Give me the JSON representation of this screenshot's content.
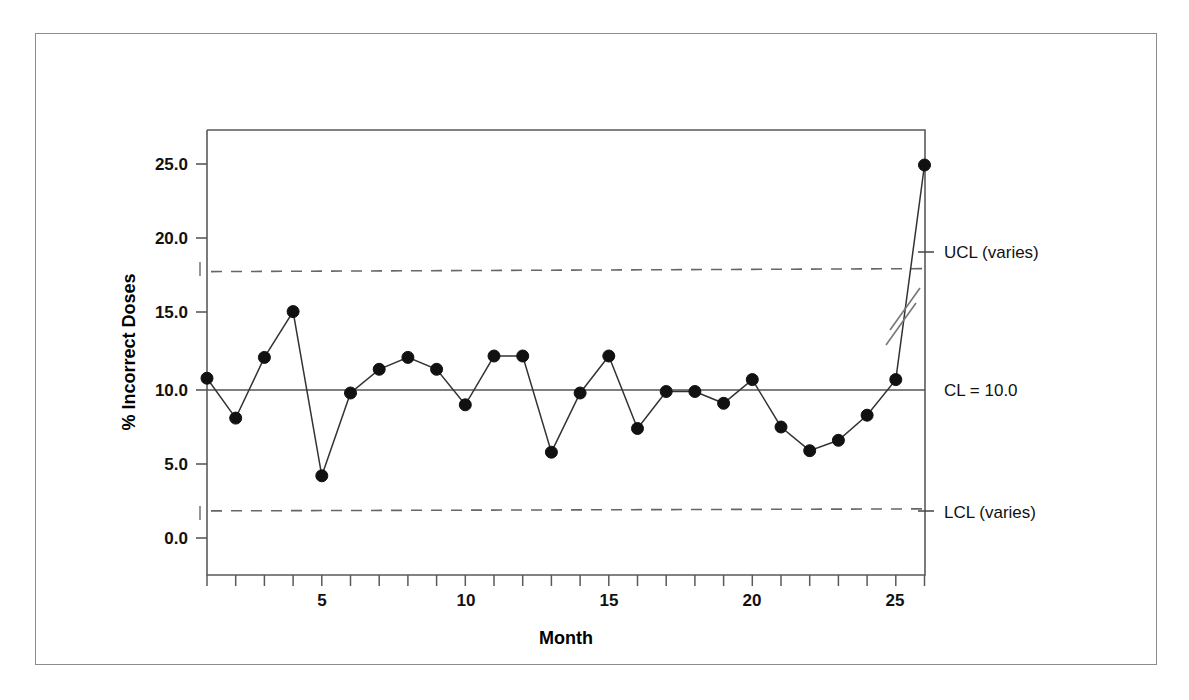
{
  "chart_data": {
    "type": "line",
    "title": "",
    "subtitle": "",
    "xlabel": "Month",
    "ylabel": "% Incorrect Doses",
    "x": [
      1,
      2,
      3,
      4,
      5,
      6,
      7,
      8,
      9,
      10,
      11,
      12,
      13,
      14,
      15,
      16,
      17,
      18,
      19,
      20,
      21,
      22,
      23,
      24,
      25,
      26
    ],
    "values": [
      10.8,
      8.1,
      12.2,
      15.3,
      4.2,
      9.8,
      11.4,
      12.2,
      11.4,
      9.0,
      12.3,
      12.3,
      5.8,
      9.8,
      12.3,
      7.4,
      9.9,
      9.9,
      9.1,
      10.7,
      7.5,
      5.9,
      6.6,
      8.3,
      10.7,
      25.2
    ],
    "series": [
      {
        "name": "% Incorrect Doses",
        "values": [
          10.8,
          8.1,
          12.2,
          15.3,
          4.2,
          9.8,
          11.4,
          12.2,
          11.4,
          9.0,
          12.3,
          12.3,
          5.8,
          9.8,
          12.3,
          7.4,
          9.9,
          9.9,
          9.1,
          10.7,
          7.5,
          5.9,
          6.6,
          8.3,
          10.7,
          25.2
        ]
      }
    ],
    "xlim": [
      0.95,
      26.2
    ],
    "ylim": [
      -0.7,
      27.3
    ],
    "xticks": [
      1,
      2,
      3,
      4,
      5,
      6,
      7,
      8,
      9,
      10,
      11,
      12,
      13,
      14,
      15,
      16,
      17,
      18,
      19,
      20,
      21,
      22,
      23,
      24,
      25,
      26
    ],
    "xtick_labels": [
      "",
      "",
      "",
      "",
      "5",
      "",
      "",
      "",
      "",
      "10",
      "",
      "",
      "",
      "",
      "15",
      "",
      "",
      "",
      "",
      "20",
      "",
      "",
      "",
      "",
      "25",
      ""
    ],
    "yticks": [
      0.0,
      5.0,
      10.0,
      15.0,
      20.0,
      25.0
    ],
    "ytick_labels": [
      "0.0",
      "5.0",
      "10.0",
      "15.0",
      "20.0",
      "25.0"
    ],
    "grid": false,
    "legend_position": "right-outside",
    "marker": "filled-circle",
    "marker_color": "#111111",
    "line_color": "#333333",
    "control_limits": {
      "center_line": {
        "label": "CL = 10.0",
        "value": 10.0,
        "style": "solid"
      },
      "upper_control_limit": {
        "label": "UCL (varies)",
        "value": 18.1,
        "style": "dashed"
      },
      "lower_control_limit": {
        "label": "LCL (varies)",
        "value": 1.9,
        "style": "dashed"
      }
    },
    "axis_break": {
      "present": true,
      "description": "double slash break on rising segment before final point"
    }
  },
  "annotations": {
    "ucl_text": "UCL (varies)",
    "cl_text": "CL = 10.0",
    "lcl_text": "LCL (varies)"
  },
  "axes": {
    "x_title": "Month",
    "y_title": "% Incorrect Doses",
    "y_labels": [
      "25.0",
      "20.0",
      "15.0",
      "10.0",
      "5.0",
      "0.0"
    ],
    "x_labels": [
      "5",
      "10",
      "15",
      "20",
      "25"
    ]
  },
  "colors": {
    "frame": "#5a5a5a",
    "outer_frame": "#8c8c8c",
    "marker": "#111111",
    "line": "#333333",
    "limit_line": "#555555",
    "center_line": "#555555",
    "text": "#111111"
  }
}
